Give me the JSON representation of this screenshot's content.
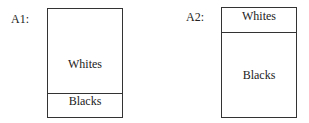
{
  "diagrams": [
    {
      "label": "A1:",
      "top": "Whites",
      "bottom": "Blacks"
    },
    {
      "label": "A2:",
      "top": "Whites",
      "bottom": "Blacks"
    }
  ]
}
